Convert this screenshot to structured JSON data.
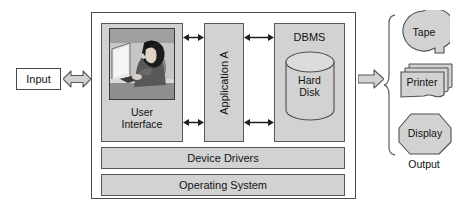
{
  "diagram": {
    "input": {
      "label": "Input"
    },
    "main": {
      "user_interface": {
        "label": "User\nInterface",
        "label_line1": "User",
        "label_line2": "Interface",
        "image_alt": "photo-of-person-at-computer-workstation"
      },
      "application": {
        "label": "Application A",
        "orientation": "vertical"
      },
      "dbms": {
        "label": "DBMS",
        "storage_label_line1": "Hard",
        "storage_label_line2": "Disk",
        "storage_shape": "cylinder"
      },
      "device_drivers": {
        "label": "Device Drivers"
      },
      "operating_system": {
        "label": "Operating System"
      }
    },
    "output": {
      "label": "Output",
      "devices": [
        {
          "label": "Tape",
          "shape": "tape-reel"
        },
        {
          "label": "Printer",
          "shape": "document-stack"
        },
        {
          "label": "Display",
          "shape": "hexagon-screen"
        }
      ]
    },
    "arrows": {
      "input_arrow": "double-headed-block-arrow",
      "output_arrow": "right-block-arrow",
      "internal_connectors": "double-headed-line-arrow",
      "internal_connector_count": 4
    },
    "colors": {
      "fill": "#d2d2d2",
      "stroke": "#585858",
      "background": "#ffffff",
      "text": "#141414"
    }
  }
}
